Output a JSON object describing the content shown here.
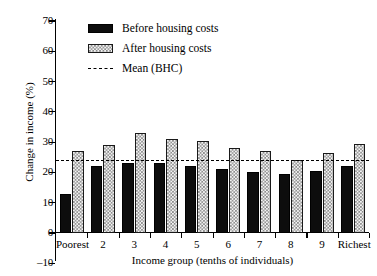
{
  "chart_data": {
    "type": "bar",
    "title": "",
    "xlabel": "Income group (tenths of individuals)",
    "ylabel": "Change in income (%)",
    "categories": [
      "Poorest",
      "2",
      "3",
      "4",
      "5",
      "6",
      "7",
      "8",
      "9",
      "Richest"
    ],
    "series": [
      {
        "name": "Before housing costs",
        "values": [
          13,
          22,
          23,
          23,
          22,
          21,
          20,
          19.5,
          20.5,
          22
        ]
      },
      {
        "name": "After housing costs",
        "values": [
          27,
          29,
          33,
          31,
          30.5,
          28,
          27,
          24,
          26.5,
          29.5
        ]
      }
    ],
    "reference_line": {
      "label": "Mean (BHC)",
      "value": 24,
      "style": "dashed"
    },
    "ylim": [
      -10,
      70
    ],
    "yticks": [
      -10,
      0,
      10,
      20,
      30,
      40,
      50,
      60,
      70
    ],
    "ytick_labels": [
      "–10",
      "0",
      "10",
      "20",
      "30",
      "40",
      "50",
      "60",
      "70"
    ],
    "grid": false,
    "legend_position": "top-left-inside"
  },
  "legend": {
    "items": [
      {
        "label": "Before housing costs",
        "swatch": "solid-black"
      },
      {
        "label": "After housing costs",
        "swatch": "checkered"
      },
      {
        "label": "Mean (BHC)",
        "swatch": "dashed-line"
      }
    ]
  },
  "colors": {
    "bhc_bar": "#0d0d0d",
    "ahc_bar_fill": "#f4f4f4",
    "ahc_bar_hatch": "#8a8a8a",
    "axis": "#000000",
    "background": "#ffffff"
  }
}
